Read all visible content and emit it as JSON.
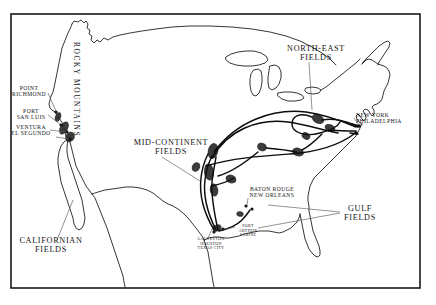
{
  "map": {
    "title": "Oil Fields, Pipelines and Refining Centres of the United States",
    "frame_color": "#1a1a1a",
    "coastline_color": "#141414",
    "pipeline_color": "#0d0d0d",
    "oilfield_color": "#2b2b2b",
    "leader_color": "#5a5a5a",
    "background": "#ffffff",
    "regions": [
      {
        "id": "rocky-mountains",
        "label": "ROCKY MOUNTAINS",
        "type": "physiographic",
        "orientation": "vertical",
        "x": 74,
        "y": 46
      },
      {
        "id": "californian-fields",
        "label": "CALIFORNIAN\nFIELDS",
        "type": "oil-field-region",
        "x": 22,
        "y": 240,
        "leader": true
      },
      {
        "id": "mid-continent-fields",
        "label": "MID-CONTINENT\nFIELDS",
        "type": "oil-field-region",
        "x": 137,
        "y": 140,
        "leader": true
      },
      {
        "id": "north-east-fields",
        "label": "NORTH-EAST\nFIELDS",
        "type": "oil-field-region",
        "x": 286,
        "y": 47,
        "leader": true
      },
      {
        "id": "gulf-fields",
        "label": "GULF\nFIELDS",
        "type": "oil-field-region",
        "x": 344,
        "y": 208,
        "leader": true
      }
    ],
    "cities": [
      {
        "id": "point-richmond",
        "label": "POINT\nRICHMOND",
        "x": 14,
        "y": 88,
        "size": "city"
      },
      {
        "id": "port-san-luis",
        "label": "PORT\nSAN LUIS",
        "x": 19,
        "y": 111,
        "size": "city"
      },
      {
        "id": "ventura-el-segundo",
        "label": "VENTURA\nEL SEGUNDO",
        "x": 15,
        "y": 128,
        "size": "city"
      },
      {
        "id": "new-york-philadelphia",
        "label": "NEW YORK\nPHILADELPHIA",
        "x": 355,
        "y": 115,
        "size": "city"
      },
      {
        "id": "baton-rouge-new-orleans",
        "label": "BATON ROUGE\nNEW ORLEANS",
        "x": 247,
        "y": 189,
        "size": "city"
      },
      {
        "id": "galveston-houston-texas-city",
        "label": "GALVESTON\nHOUSTON\nTEXAS CITY",
        "x": 194,
        "y": 231,
        "size": "city-small"
      },
      {
        "id": "port-arthur-sabine",
        "label": "PORT\nARTHUR\nSABINE",
        "x": 237,
        "y": 223,
        "size": "city-small"
      }
    ]
  }
}
